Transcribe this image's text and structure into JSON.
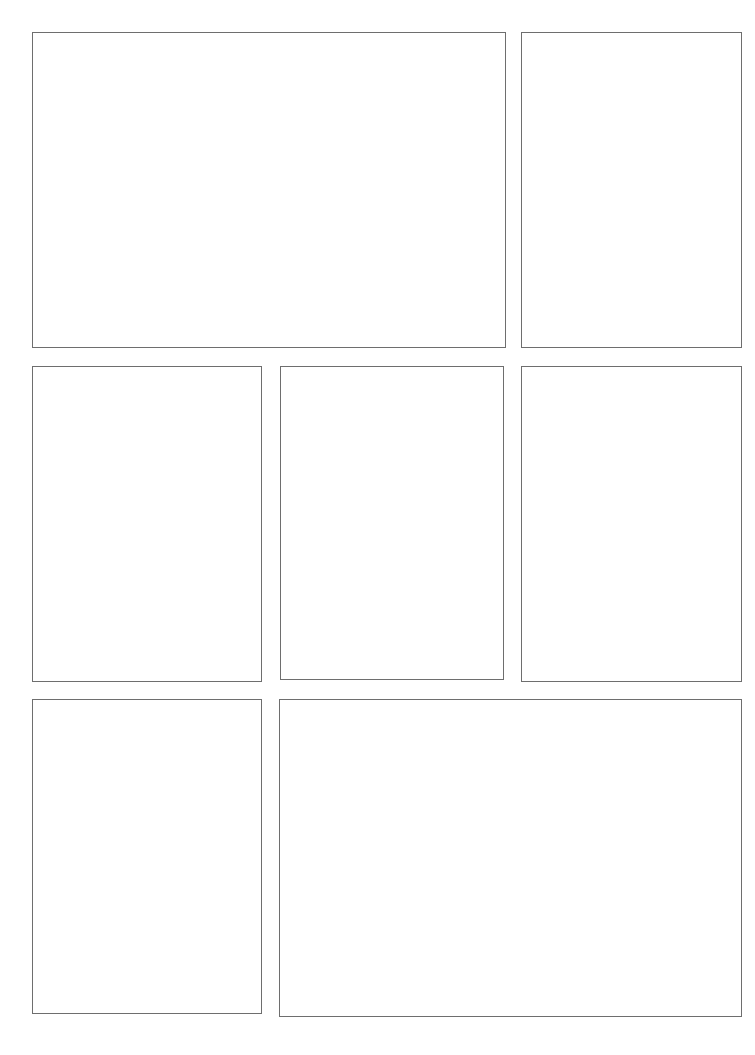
{
  "page": {
    "background_color": "#ffffff",
    "width": 755,
    "height": 1055
  },
  "style": {
    "panel_border_color": "#6e6e6e",
    "panel_border_width_px": 1,
    "panel_fill_color": "#ffffff"
  },
  "panels": [
    {
      "id": "panel-row1-left",
      "row": 1,
      "column": 1,
      "content": "",
      "x": 32,
      "y": 32,
      "width": 474,
      "height": 316
    },
    {
      "id": "panel-row1-right",
      "row": 1,
      "column": 2,
      "content": "",
      "x": 521,
      "y": 32,
      "width": 221,
      "height": 316
    },
    {
      "id": "panel-row2-left",
      "row": 2,
      "column": 1,
      "content": "",
      "x": 32,
      "y": 366,
      "width": 230,
      "height": 316
    },
    {
      "id": "panel-row2-middle",
      "row": 2,
      "column": 2,
      "content": "",
      "x": 280,
      "y": 366,
      "width": 224,
      "height": 314
    },
    {
      "id": "panel-row2-right",
      "row": 2,
      "column": 3,
      "content": "",
      "x": 521,
      "y": 366,
      "width": 221,
      "height": 316
    },
    {
      "id": "panel-row3-left",
      "row": 3,
      "column": 1,
      "content": "",
      "x": 32,
      "y": 699,
      "width": 230,
      "height": 315
    },
    {
      "id": "panel-row3-right",
      "row": 3,
      "column": 2,
      "content": "",
      "x": 279,
      "y": 699,
      "width": 463,
      "height": 318
    }
  ]
}
